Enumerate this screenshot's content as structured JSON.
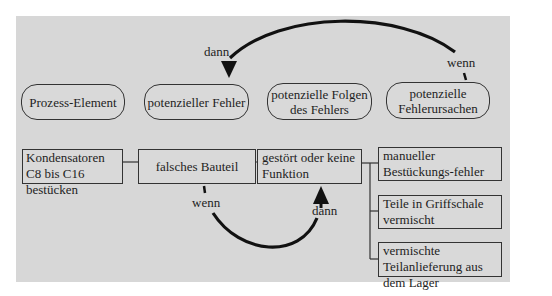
{
  "header_labels": {
    "process_element": "Prozess-Element",
    "potential_failure": "potenzieller Fehler",
    "potential_effects": "potenzielle Folgen des Fehlers",
    "potential_causes": "potenzielle Fehlerursachen"
  },
  "top_arrow": {
    "from_label": "wenn",
    "to_label": "dann"
  },
  "bottom_arrow": {
    "from_label": "wenn",
    "to_label": "dann"
  },
  "row": {
    "process_step": "Kondensatoren C8 bis C16 bestücken",
    "failure": "falsches Bauteil",
    "effect": "gestört oder keine Funktion",
    "causes": [
      "manueller Bestückungs-fehler",
      "Teile in Griffschale vermischt",
      "vermischte Teilanlieferung aus dem Lager"
    ]
  },
  "colors": {
    "panel": "#d7d7d7",
    "line": "#333333",
    "arrow": "#111111"
  }
}
